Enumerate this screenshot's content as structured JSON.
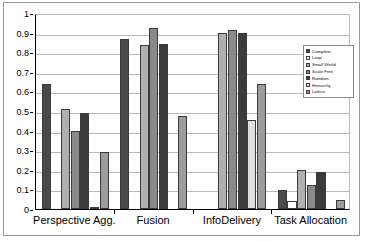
{
  "chart_data": {
    "type": "bar",
    "title": "",
    "subtitle": "",
    "xlabel": "",
    "ylabel": "",
    "ylim": [
      0,
      1
    ],
    "grid": true,
    "legend_position": "right",
    "categories": [
      "Perspective Agg.",
      "Fusion",
      "InfoDelivery",
      "Task Allocation"
    ],
    "y_ticks": [
      "0",
      "0.1",
      "0.2",
      "0.3",
      "0.4",
      "0.5",
      "0.6",
      "0.7",
      "0.8",
      "0.9",
      "1"
    ],
    "series": [
      {
        "name": "Complete",
        "color": "#4a4a4a",
        "values": [
          0.64,
          0.865,
          0.0,
          0.095
        ]
      },
      {
        "name": "Loop",
        "color": "#ffffff",
        "values": [
          0.0,
          0.0,
          0.0,
          0.04
        ]
      },
      {
        "name": "Small World",
        "color": "#b0b0b0",
        "values": [
          0.51,
          0.835,
          0.9,
          0.2
        ]
      },
      {
        "name": "Scale Free",
        "color": "#8a8a8a",
        "values": [
          0.4,
          0.925,
          0.915,
          0.12
        ]
      },
      {
        "name": "Random",
        "color": "#3b3b3b",
        "values": [
          0.49,
          0.84,
          0.9,
          0.19
        ]
      },
      {
        "name": "Hierarchy",
        "color": "#e0e0e0",
        "values": [
          0.01,
          0.0,
          0.455,
          0.0
        ]
      },
      {
        "name": "Lattice",
        "color": "#9c9c9c",
        "values": [
          0.29,
          0.475,
          0.64,
          0.045
        ]
      }
    ]
  },
  "legend": {
    "items": [
      "Complete",
      "Loop",
      "Small World",
      "Scale Free",
      "Random",
      "Hierarchy",
      "Lattice"
    ]
  }
}
